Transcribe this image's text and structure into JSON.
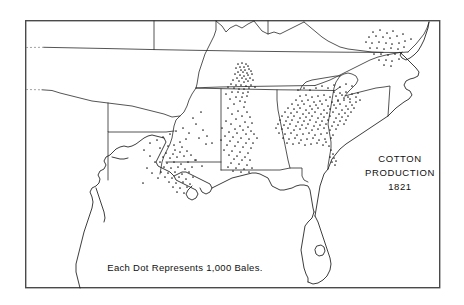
{
  "figure": {
    "kind": "dot-density-map",
    "width": 464,
    "height": 305,
    "background_color": "#ffffff",
    "frame": {
      "name": "map-border",
      "x": 25,
      "y": 20,
      "width": 415,
      "height": 268,
      "stroke_color": "#4a4a4a"
    }
  },
  "title": {
    "line1": "COTTON",
    "line2": "PRODUCTION",
    "line3": "1821"
  },
  "legend": {
    "caption": "Each Dot Represents 1,000 Bales."
  },
  "chart_data": {
    "type": "scatter",
    "title": "COTTON PRODUCTION 1821",
    "subtitle": "Each Dot Represents 1,000 Bales.",
    "xlabel": "",
    "ylabel": "",
    "dot_value": 1000,
    "dot_unit": "bales",
    "dot_color": "#232323",
    "grid": false,
    "legend_position": "bottom-center",
    "note": "Dot-density map of the US Cotton Belt. Each dot = 1,000 bales of cotton produced in 1821. Point coordinates below are in screenshot pixel space (x right, y down) within the 464x305 frame.",
    "clusters": [
      {
        "region": "Middle Tennessee",
        "approx_center": [
          243,
          71
        ],
        "dot_count": 46,
        "density": "very-high"
      },
      {
        "region": "Northern Alabama / Tennessee Valley",
        "approx_center": [
          240,
          85
        ],
        "dot_count": 30,
        "density": "high"
      },
      {
        "region": "Central Alabama Black Belt",
        "approx_center": [
          238,
          135
        ],
        "dot_count": 44,
        "density": "high"
      },
      {
        "region": "Central / Eastern Georgia",
        "approx_center": [
          322,
          108
        ],
        "dot_count": 120,
        "density": "very-high"
      },
      {
        "region": "Western Georgia / Upcountry",
        "approx_center": [
          296,
          124
        ],
        "dot_count": 52,
        "density": "high"
      },
      {
        "region": "South Carolina Midlands",
        "approx_center": [
          342,
          104
        ],
        "dot_count": 34,
        "density": "medium"
      },
      {
        "region": "Savannah River Valley",
        "approx_center": [
          334,
          148
        ],
        "dot_count": 22,
        "density": "medium"
      },
      {
        "region": "Eastern North Carolina",
        "approx_center": [
          380,
          42
        ],
        "dot_count": 34,
        "density": "medium"
      },
      {
        "region": "Mississippi River Valley / Natchez",
        "approx_center": [
          176,
          160
        ],
        "dot_count": 30,
        "density": "medium"
      },
      {
        "region": "Louisiana / Red River",
        "approx_center": [
          170,
          175
        ],
        "dot_count": 26,
        "density": "medium"
      },
      {
        "region": "Southwest Mississippi",
        "approx_center": [
          190,
          150
        ],
        "dot_count": 18,
        "density": "low"
      },
      {
        "region": "Scattered interior Mississippi",
        "approx_center": [
          200,
          120
        ],
        "dot_count": 12,
        "density": "low"
      }
    ],
    "points": [
      [
        373,
        32
      ],
      [
        380,
        30
      ],
      [
        387,
        33
      ],
      [
        393,
        31
      ],
      [
        369,
        37
      ],
      [
        376,
        36
      ],
      [
        383,
        37
      ],
      [
        390,
        38
      ],
      [
        397,
        36
      ],
      [
        403,
        34
      ],
      [
        366,
        42
      ],
      [
        372,
        43
      ],
      [
        379,
        42
      ],
      [
        386,
        43
      ],
      [
        392,
        44
      ],
      [
        399,
        43
      ],
      [
        405,
        41
      ],
      [
        411,
        39
      ],
      [
        370,
        48
      ],
      [
        377,
        48
      ],
      [
        384,
        49
      ],
      [
        391,
        48
      ],
      [
        398,
        49
      ],
      [
        404,
        47
      ],
      [
        374,
        54
      ],
      [
        381,
        54
      ],
      [
        388,
        55
      ],
      [
        395,
        54
      ],
      [
        401,
        53
      ],
      [
        379,
        60
      ],
      [
        386,
        60
      ],
      [
        392,
        61
      ],
      [
        399,
        59
      ],
      [
        384,
        65
      ],
      [
        391,
        66
      ],
      [
        238,
        64
      ],
      [
        242,
        63
      ],
      [
        246,
        64
      ],
      [
        240,
        67
      ],
      [
        244,
        67
      ],
      [
        248,
        66
      ],
      [
        236,
        68
      ],
      [
        241,
        70
      ],
      [
        245,
        70
      ],
      [
        249,
        69
      ],
      [
        238,
        72
      ],
      [
        243,
        72
      ],
      [
        247,
        73
      ],
      [
        251,
        71
      ],
      [
        235,
        74
      ],
      [
        240,
        75
      ],
      [
        244,
        76
      ],
      [
        248,
        75
      ],
      [
        252,
        74
      ],
      [
        237,
        78
      ],
      [
        242,
        78
      ],
      [
        246,
        79
      ],
      [
        250,
        78
      ],
      [
        233,
        80
      ],
      [
        239,
        81
      ],
      [
        244,
        82
      ],
      [
        248,
        81
      ],
      [
        253,
        80
      ],
      [
        231,
        84
      ],
      [
        236,
        85
      ],
      [
        241,
        85
      ],
      [
        246,
        86
      ],
      [
        251,
        85
      ],
      [
        228,
        87
      ],
      [
        234,
        88
      ],
      [
        239,
        89
      ],
      [
        244,
        89
      ],
      [
        249,
        88
      ],
      [
        255,
        87
      ],
      [
        232,
        92
      ],
      [
        238,
        92
      ],
      [
        243,
        93
      ],
      [
        248,
        92
      ],
      [
        226,
        94
      ],
      [
        236,
        97
      ],
      [
        242,
        97
      ],
      [
        247,
        96
      ],
      [
        230,
        99
      ],
      [
        240,
        101
      ],
      [
        245,
        102
      ],
      [
        234,
        104
      ],
      [
        244,
        107
      ],
      [
        228,
        108
      ],
      [
        238,
        111
      ],
      [
        247,
        112
      ],
      [
        232,
        114
      ],
      [
        242,
        116
      ],
      [
        250,
        117
      ],
      [
        236,
        119
      ],
      [
        226,
        121
      ],
      [
        245,
        122
      ],
      [
        252,
        123
      ],
      [
        231,
        124
      ],
      [
        240,
        126
      ],
      [
        248,
        127
      ],
      [
        222,
        128
      ],
      [
        235,
        129
      ],
      [
        243,
        130
      ],
      [
        251,
        131
      ],
      [
        229,
        132
      ],
      [
        237,
        133
      ],
      [
        246,
        134
      ],
      [
        254,
        134
      ],
      [
        225,
        136
      ],
      [
        233,
        137
      ],
      [
        241,
        138
      ],
      [
        249,
        139
      ],
      [
        257,
        138
      ],
      [
        221,
        140
      ],
      [
        230,
        141
      ],
      [
        238,
        142
      ],
      [
        246,
        143
      ],
      [
        253,
        143
      ],
      [
        227,
        145
      ],
      [
        235,
        146
      ],
      [
        243,
        147
      ],
      [
        251,
        148
      ],
      [
        224,
        150
      ],
      [
        232,
        151
      ],
      [
        240,
        152
      ],
      [
        248,
        153
      ],
      [
        229,
        155
      ],
      [
        237,
        156
      ],
      [
        245,
        157
      ],
      [
        234,
        159
      ],
      [
        242,
        160
      ],
      [
        250,
        160
      ],
      [
        231,
        163
      ],
      [
        239,
        164
      ],
      [
        247,
        165
      ],
      [
        228,
        167
      ],
      [
        236,
        168
      ],
      [
        244,
        169
      ],
      [
        252,
        168
      ],
      [
        233,
        171
      ],
      [
        241,
        172
      ],
      [
        249,
        172
      ],
      [
        300,
        96
      ],
      [
        306,
        95
      ],
      [
        312,
        97
      ],
      [
        318,
        96
      ],
      [
        324,
        95
      ],
      [
        330,
        97
      ],
      [
        336,
        96
      ],
      [
        342,
        95
      ],
      [
        348,
        97
      ],
      [
        296,
        100
      ],
      [
        302,
        101
      ],
      [
        308,
        100
      ],
      [
        314,
        102
      ],
      [
        320,
        101
      ],
      [
        326,
        100
      ],
      [
        332,
        102
      ],
      [
        338,
        101
      ],
      [
        344,
        100
      ],
      [
        350,
        102
      ],
      [
        292,
        104
      ],
      [
        298,
        105
      ],
      [
        304,
        104
      ],
      [
        310,
        106
      ],
      [
        316,
        105
      ],
      [
        322,
        104
      ],
      [
        328,
        106
      ],
      [
        334,
        105
      ],
      [
        340,
        104
      ],
      [
        346,
        106
      ],
      [
        352,
        105
      ],
      [
        288,
        108
      ],
      [
        294,
        109
      ],
      [
        300,
        108
      ],
      [
        306,
        110
      ],
      [
        312,
        109
      ],
      [
        318,
        108
      ],
      [
        324,
        110
      ],
      [
        330,
        109
      ],
      [
        336,
        108
      ],
      [
        342,
        110
      ],
      [
        348,
        109
      ],
      [
        354,
        108
      ],
      [
        285,
        112
      ],
      [
        291,
        113
      ],
      [
        297,
        112
      ],
      [
        303,
        114
      ],
      [
        309,
        113
      ],
      [
        315,
        112
      ],
      [
        321,
        114
      ],
      [
        327,
        113
      ],
      [
        333,
        112
      ],
      [
        339,
        114
      ],
      [
        345,
        113
      ],
      [
        351,
        112
      ],
      [
        282,
        116
      ],
      [
        288,
        117
      ],
      [
        294,
        116
      ],
      [
        300,
        118
      ],
      [
        306,
        117
      ],
      [
        312,
        116
      ],
      [
        318,
        118
      ],
      [
        324,
        117
      ],
      [
        330,
        116
      ],
      [
        336,
        118
      ],
      [
        342,
        117
      ],
      [
        348,
        116
      ],
      [
        280,
        120
      ],
      [
        286,
        121
      ],
      [
        292,
        120
      ],
      [
        298,
        122
      ],
      [
        304,
        121
      ],
      [
        310,
        120
      ],
      [
        316,
        122
      ],
      [
        322,
        121
      ],
      [
        328,
        120
      ],
      [
        334,
        122
      ],
      [
        340,
        121
      ],
      [
        346,
        120
      ],
      [
        278,
        124
      ],
      [
        284,
        125
      ],
      [
        290,
        124
      ],
      [
        296,
        126
      ],
      [
        302,
        125
      ],
      [
        308,
        124
      ],
      [
        314,
        126
      ],
      [
        320,
        125
      ],
      [
        326,
        124
      ],
      [
        332,
        126
      ],
      [
        338,
        125
      ],
      [
        344,
        124
      ],
      [
        276,
        128
      ],
      [
        282,
        129
      ],
      [
        288,
        128
      ],
      [
        294,
        130
      ],
      [
        300,
        129
      ],
      [
        306,
        128
      ],
      [
        312,
        130
      ],
      [
        318,
        129
      ],
      [
        324,
        128
      ],
      [
        330,
        130
      ],
      [
        336,
        129
      ],
      [
        279,
        133
      ],
      [
        285,
        134
      ],
      [
        291,
        133
      ],
      [
        297,
        135
      ],
      [
        303,
        134
      ],
      [
        309,
        133
      ],
      [
        315,
        135
      ],
      [
        321,
        134
      ],
      [
        327,
        133
      ],
      [
        333,
        135
      ],
      [
        283,
        138
      ],
      [
        289,
        139
      ],
      [
        295,
        138
      ],
      [
        301,
        140
      ],
      [
        307,
        139
      ],
      [
        313,
        138
      ],
      [
        319,
        140
      ],
      [
        325,
        139
      ],
      [
        331,
        138
      ],
      [
        287,
        143
      ],
      [
        293,
        144
      ],
      [
        299,
        143
      ],
      [
        305,
        145
      ],
      [
        311,
        144
      ],
      [
        317,
        143
      ],
      [
        323,
        145
      ],
      [
        326,
        142
      ],
      [
        329,
        146
      ],
      [
        331,
        150
      ],
      [
        333,
        154
      ],
      [
        330,
        157
      ],
      [
        334,
        158
      ],
      [
        336,
        161
      ],
      [
        332,
        162
      ],
      [
        335,
        165
      ],
      [
        338,
        100
      ],
      [
        344,
        98
      ],
      [
        350,
        99
      ],
      [
        356,
        97
      ],
      [
        352,
        94
      ],
      [
        358,
        93
      ],
      [
        346,
        92
      ],
      [
        340,
        93
      ],
      [
        334,
        92
      ],
      [
        356,
        102
      ],
      [
        360,
        100
      ],
      [
        160,
        148
      ],
      [
        168,
        146
      ],
      [
        175,
        150
      ],
      [
        182,
        147
      ],
      [
        166,
        153
      ],
      [
        173,
        154
      ],
      [
        180,
        152
      ],
      [
        187,
        151
      ],
      [
        163,
        157
      ],
      [
        170,
        158
      ],
      [
        177,
        157
      ],
      [
        184,
        156
      ],
      [
        191,
        155
      ],
      [
        160,
        162
      ],
      [
        167,
        163
      ],
      [
        174,
        162
      ],
      [
        181,
        164
      ],
      [
        188,
        162
      ],
      [
        195,
        160
      ],
      [
        164,
        167
      ],
      [
        171,
        168
      ],
      [
        178,
        167
      ],
      [
        185,
        169
      ],
      [
        192,
        167
      ],
      [
        161,
        172
      ],
      [
        168,
        173
      ],
      [
        175,
        172
      ],
      [
        182,
        174
      ],
      [
        189,
        172
      ],
      [
        165,
        177
      ],
      [
        172,
        178
      ],
      [
        179,
        177
      ],
      [
        186,
        179
      ],
      [
        193,
        177
      ],
      [
        169,
        182
      ],
      [
        176,
        183
      ],
      [
        183,
        182
      ],
      [
        190,
        184
      ],
      [
        173,
        187
      ],
      [
        180,
        188
      ],
      [
        187,
        187
      ],
      [
        177,
        192
      ],
      [
        184,
        193
      ],
      [
        144,
        150
      ],
      [
        150,
        156
      ],
      [
        155,
        162
      ],
      [
        147,
        168
      ],
      [
        152,
        173
      ],
      [
        158,
        178
      ],
      [
        143,
        183
      ],
      [
        196,
        124
      ],
      [
        203,
        130
      ],
      [
        199,
        138
      ],
      [
        206,
        144
      ],
      [
        193,
        118
      ],
      [
        201,
        112
      ],
      [
        207,
        136
      ],
      [
        212,
        143
      ],
      [
        196,
        160
      ],
      [
        202,
        166
      ],
      [
        150,
        143
      ],
      [
        157,
        140
      ],
      [
        163,
        137
      ],
      [
        170,
        134
      ],
      [
        176,
        131
      ],
      [
        183,
        128
      ],
      [
        189,
        133
      ],
      [
        186,
        139
      ],
      [
        180,
        142
      ],
      [
        174,
        145
      ],
      [
        316,
        88
      ],
      [
        322,
        86
      ],
      [
        328,
        88
      ],
      [
        334,
        85
      ],
      [
        340,
        87
      ],
      [
        346,
        84
      ],
      [
        352,
        86
      ],
      [
        310,
        90
      ],
      [
        304,
        88
      ],
      [
        298,
        90
      ]
    ]
  },
  "icons": {
    "dot": "production-dot"
  }
}
